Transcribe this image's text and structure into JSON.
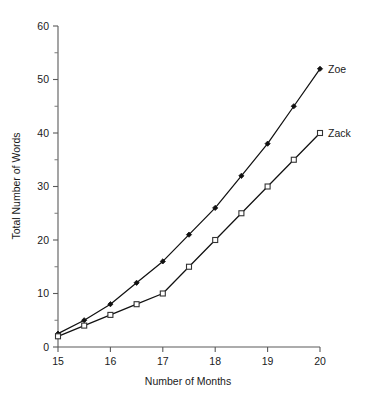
{
  "chart_data": {
    "type": "line",
    "title": "",
    "xlabel": "Number of Months",
    "ylabel": "Total Number of Words",
    "xlim": [
      15,
      20
    ],
    "ylim": [
      0,
      60
    ],
    "x_ticks": [
      15,
      16,
      17,
      18,
      19,
      20
    ],
    "x_tick_labels": [
      "15",
      "16",
      "17",
      "18",
      "19",
      "20"
    ],
    "y_ticks": [
      0,
      10,
      20,
      30,
      40,
      50,
      60
    ],
    "y_tick_labels": [
      "0",
      "10",
      "20",
      "30",
      "40",
      "50",
      "60"
    ],
    "y_minor_ticks": [
      5,
      15,
      25,
      35,
      45,
      55
    ],
    "grid": false,
    "legend_position": "right-of-line-ends",
    "x": [
      15,
      15.5,
      16,
      16.5,
      17,
      17.5,
      18,
      18.5,
      19,
      19.5,
      20
    ],
    "series": [
      {
        "name": "Zoe",
        "marker": "filled-diamond",
        "values": [
          2.5,
          5,
          8,
          12,
          16,
          21,
          26,
          32,
          38,
          45,
          52
        ]
      },
      {
        "name": "Zack",
        "marker": "open-square",
        "values": [
          2,
          4,
          6,
          8,
          10,
          15,
          20,
          25,
          30,
          35,
          40
        ]
      }
    ]
  },
  "labels": {
    "zoe": "Zoe",
    "zack": "Zack"
  },
  "colors": {
    "line": "#111111",
    "axis": "#5a5a5a",
    "background": "#ffffff"
  }
}
